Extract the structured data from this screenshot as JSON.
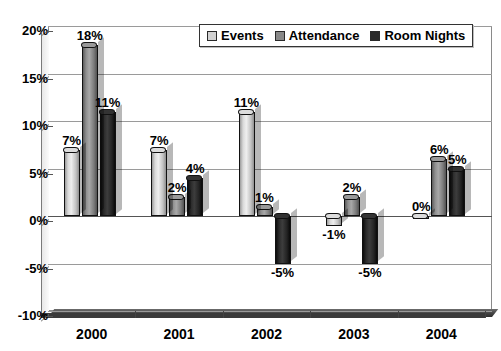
{
  "chart_data": {
    "type": "bar",
    "title": "",
    "xlabel": "",
    "ylabel": "",
    "categories": [
      "2000",
      "2001",
      "2002",
      "2003",
      "2004"
    ],
    "series": [
      {
        "name": "Events",
        "color": "#d2d2d2",
        "values": [
          7,
          7,
          11,
          -1,
          0
        ]
      },
      {
        "name": "Attendance",
        "color": "#898989",
        "values": [
          18,
          2,
          1,
          2,
          6
        ]
      },
      {
        "name": "Room Nights",
        "color": "#2a2a2a",
        "values": [
          11,
          4,
          -5,
          -5,
          5
        ]
      }
    ],
    "value_labels": [
      [
        "7%",
        "7%",
        "11%",
        "-1%",
        "0%"
      ],
      [
        "18%",
        "2%",
        "1%",
        "2%",
        "6%"
      ],
      [
        "11%",
        "4%",
        "-5%",
        "-5%",
        "5%"
      ]
    ],
    "ylim": [
      -10,
      20
    ],
    "ytick_values": [
      20,
      15,
      10,
      5,
      0,
      -5,
      -10
    ],
    "ytick_labels": [
      "20%",
      "15%",
      "10%",
      "5%",
      "0%",
      "-5%",
      "-10%"
    ],
    "grid": true,
    "legend_position": "top-center"
  },
  "legend": {
    "items": [
      {
        "label": "Events"
      },
      {
        "label": "Attendance"
      },
      {
        "label": "Room Nights"
      }
    ]
  }
}
